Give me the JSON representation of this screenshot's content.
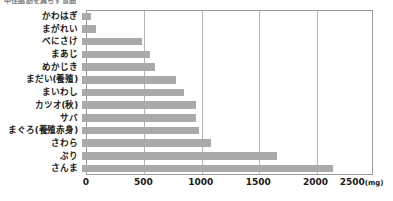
{
  "caption_sliver": "中性脂肪を減らす食品",
  "chart_data": {
    "type": "bar",
    "orientation": "horizontal",
    "title": "",
    "xlabel": "(mg)",
    "ylabel": "",
    "unit_label": "(mg)",
    "xlim": [
      0,
      2500
    ],
    "xticks": [
      0,
      500,
      1000,
      1500,
      2000,
      2500
    ],
    "xtick_labels": [
      "0",
      "500",
      "1000",
      "1500",
      "2000",
      "2500"
    ],
    "grid": true,
    "grid_axis": "x",
    "legend": null,
    "bar_color": "#aaaaaa",
    "frame_color": "#9a9a9a",
    "gridline_color": "#b4b4b4",
    "categories": [
      "かわはぎ",
      "まがれい",
      "べにさけ",
      "まあじ",
      "めかじき",
      "まだい(養殖)",
      "まいわし",
      "カツオ(秋)",
      "サバ",
      "まぐろ(養殖赤身)",
      "さわら",
      "ぶり",
      "さんま"
    ],
    "values": [
      80,
      120,
      520,
      590,
      640,
      820,
      890,
      990,
      990,
      1020,
      1120,
      1700,
      2190
    ]
  }
}
